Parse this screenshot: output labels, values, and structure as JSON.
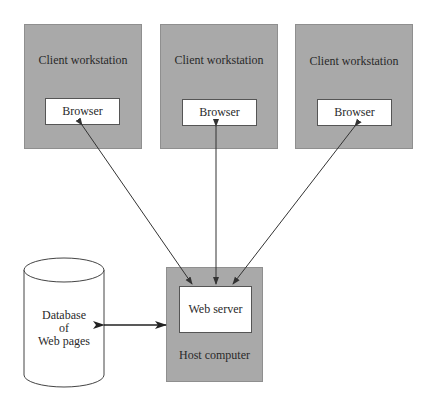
{
  "clients": [
    {
      "label": "Client workstation",
      "browser": "Browser"
    },
    {
      "label": "Client workstation",
      "browser": "Browser"
    },
    {
      "label": "Client workstation",
      "browser": "Browser"
    }
  ],
  "host": {
    "label": "Host computer",
    "server": "Web server"
  },
  "database": {
    "line1": "Database",
    "line2": "of",
    "line3": "Web pages"
  },
  "colors": {
    "box_fill": "#a9a9a9",
    "inner_fill": "#ffffff",
    "line": "#333333"
  }
}
